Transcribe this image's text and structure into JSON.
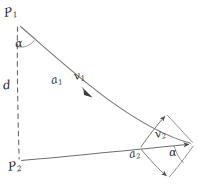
{
  "figure": {
    "kind": "hand-drawn-geometry-sketch",
    "background_color": "#ffffff",
    "ink_color": "#555555",
    "label_color": "#2b2b2b"
  },
  "labels": {
    "p1": {
      "base": "P",
      "sub": "1"
    },
    "p2": {
      "base": "P",
      "sub": "2"
    },
    "a1": {
      "base": "a",
      "sub": "1"
    },
    "a2": {
      "base": "a",
      "sub": "2"
    },
    "v1": {
      "base": "v",
      "sub": "1"
    },
    "v2": {
      "base": "v",
      "sub": "2"
    },
    "d": {
      "base": "d",
      "sub": ""
    },
    "alpha_top": {
      "base": "α",
      "sub": ""
    },
    "alpha_bottom": {
      "base": "α",
      "sub": ""
    }
  },
  "geometry": {
    "points": {
      "P1": {
        "x": 18,
        "y": 20
      },
      "P2": {
        "x": 20,
        "y": 163
      },
      "O2": {
        "x": 140,
        "y": 148
      },
      "diamond_top": {
        "x": 166,
        "y": 114
      },
      "diamond_right": {
        "x": 194,
        "y": 144
      },
      "diamond_bottom": {
        "x": 168,
        "y": 178
      }
    },
    "segments": [
      {
        "name": "d-dashed-line",
        "from": "P1",
        "to": "P2",
        "style": "dashed"
      },
      {
        "name": "v1-ray",
        "from": "P1",
        "to": "diamond_right",
        "style": "solid",
        "arrow": true
      },
      {
        "name": "v2-baseline",
        "from": "P2",
        "to": "diamond_right",
        "style": "solid",
        "arrow": true
      },
      {
        "name": "diamond-upper-left",
        "from": "O2",
        "to": "diamond_top",
        "style": "solid",
        "arrow": true
      },
      {
        "name": "diamond-upper-right",
        "from": "diamond_top",
        "to": "diamond_right",
        "style": "solid"
      },
      {
        "name": "diamond-lower-left",
        "from": "O2",
        "to": "diamond_bottom",
        "style": "solid",
        "arrow": true
      },
      {
        "name": "diamond-lower-right",
        "from": "diamond_bottom",
        "to": "diamond_right",
        "style": "solid"
      }
    ],
    "angle_arcs": [
      {
        "name": "alpha-at-P1",
        "vertex": "P1",
        "between": [
          "d-dashed-line",
          "v1-ray"
        ]
      },
      {
        "name": "alpha-at-diamond-right",
        "vertex": "diamond_right",
        "between": [
          "v2-baseline",
          "diamond-lower-right"
        ]
      }
    ]
  }
}
